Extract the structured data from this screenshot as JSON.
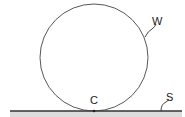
{
  "diagram": {
    "title": "",
    "labels": {
      "wheel": "W",
      "contact_point": "C",
      "surface": "S"
    },
    "colors": {
      "stroke": "#333333",
      "ground_fill": "#d9d9d9",
      "background": "#ffffff"
    }
  }
}
